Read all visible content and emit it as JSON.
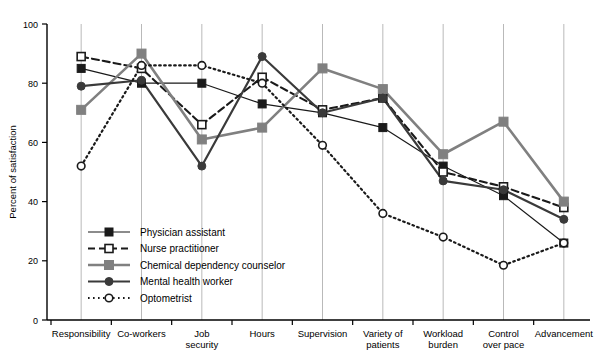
{
  "chart_data": {
    "type": "line",
    "title": "",
    "xlabel": "",
    "ylabel": "Percent of satisfaction",
    "ylim": [
      0,
      100
    ],
    "yticks": [
      "0",
      "20",
      "40",
      "60",
      "80",
      "100"
    ],
    "grid": "vertical gridlines at each category",
    "legend_position": "inside lower-left",
    "categories": [
      "Responsibility",
      "Co-workers",
      "Job security",
      "Hours",
      "Supervision",
      "Variety of patients",
      "Workload burden",
      "Control over pace",
      "Advancement"
    ],
    "category_lines": [
      [
        "Responsibility"
      ],
      [
        "Co-workers"
      ],
      [
        "Job",
        "security"
      ],
      [
        "Hours"
      ],
      [
        "Supervision"
      ],
      [
        "Variety of",
        "patients"
      ],
      [
        "Workload",
        "burden"
      ],
      [
        "Control",
        "over pace"
      ],
      [
        "Advancement"
      ]
    ],
    "series": [
      {
        "name": "Physician assistant",
        "color": "#1a1a1a",
        "marker": "filled-square",
        "dash": "solid",
        "values": [
          85,
          80,
          80,
          73,
          70,
          65,
          52,
          42,
          26
        ]
      },
      {
        "name": "Nurse practitioner",
        "color": "#1a1a1a",
        "marker": "open-square",
        "dash": "dashed",
        "values": [
          89,
          85,
          66,
          82,
          71,
          75,
          50,
          45,
          38
        ]
      },
      {
        "name": "Chemical dependency counselor",
        "color": "#808080",
        "marker": "filled-square-gray",
        "dash": "solid",
        "values": [
          71,
          90,
          61,
          65,
          85,
          78,
          56,
          67,
          40
        ]
      },
      {
        "name": "Mental health worker",
        "color": "#3a3a3a",
        "marker": "filled-circle",
        "dash": "solid",
        "values": [
          79,
          81,
          52,
          89,
          70,
          75,
          47,
          44,
          34
        ]
      },
      {
        "name": "Optometrist",
        "color": "#1a1a1a",
        "marker": "open-circle",
        "dash": "dotted",
        "values": [
          52,
          86,
          86,
          80,
          59,
          36,
          28,
          18.5,
          26
        ]
      }
    ]
  },
  "legend": {
    "items": [
      "Physician assistant",
      "Nurse practitioner",
      "Chemical dependency counselor",
      "Mental health worker",
      "Optometrist"
    ]
  }
}
